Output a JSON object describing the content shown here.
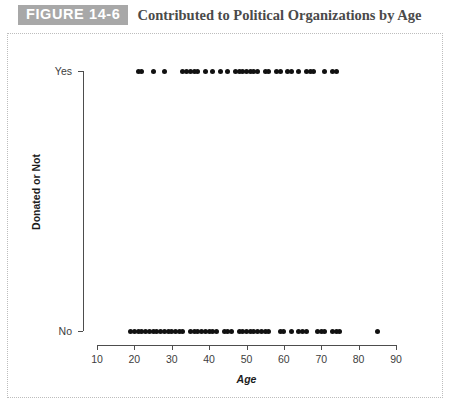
{
  "figure": {
    "badge": "FIGURE 14-6",
    "title": "Contributed to Political Organizations by Age"
  },
  "colors": {
    "badge_background": "#a8a8a8",
    "badge_text": "#ffffff",
    "title_text": "#4a4a4a",
    "axis": "#4d4d4d",
    "point": "#111111",
    "panel_border": "#bdbdbd",
    "background": "#ffffff"
  },
  "chart_data": {
    "type": "scatter",
    "title": "Contributed to Political Organizations by Age",
    "xlabel": "Age",
    "ylabel": "Donated or Not",
    "xlim": [
      10,
      90
    ],
    "ylim_categories": [
      "No",
      "Yes"
    ],
    "xticks": [
      10,
      20,
      30,
      40,
      50,
      60,
      70,
      80,
      90
    ],
    "xtick_labels": [
      "10",
      "20",
      "30",
      "40",
      "50",
      "60",
      "70",
      "80",
      "90"
    ],
    "yticks": [
      0,
      1
    ],
    "ytick_labels": [
      "No",
      "Yes"
    ],
    "grid": false,
    "legend": null,
    "series": [
      {
        "name": "Yes",
        "y_label": "Yes",
        "y_value": 1,
        "x": [
          21,
          22,
          25,
          28,
          33,
          34,
          35,
          36,
          37,
          39,
          41,
          43,
          45,
          47,
          48,
          49,
          50,
          51,
          52,
          53,
          55,
          56,
          58,
          59,
          61,
          62,
          64,
          66,
          67,
          68,
          71,
          73,
          74
        ]
      },
      {
        "name": "No",
        "y_label": "No",
        "y_value": 0,
        "x": [
          19,
          20,
          21,
          22,
          23,
          24,
          25,
          26,
          27,
          28,
          29,
          30,
          31,
          32,
          33,
          35,
          36,
          37,
          38,
          39,
          40,
          41,
          42,
          44,
          45,
          46,
          48,
          49,
          50,
          51,
          52,
          53,
          54,
          55,
          56,
          59,
          60,
          62,
          64,
          65,
          66,
          69,
          70,
          71,
          73,
          74,
          75,
          85
        ]
      }
    ]
  }
}
